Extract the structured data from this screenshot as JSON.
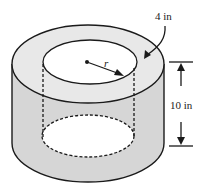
{
  "diagram": {
    "type": "hollow-cylinder",
    "labels": {
      "thickness": "4 in",
      "radius": "r",
      "height": "10 in"
    },
    "colors": {
      "fill_gray": "#d9d9d9",
      "stroke": "#1a1a1a",
      "background": "#ffffff"
    }
  }
}
